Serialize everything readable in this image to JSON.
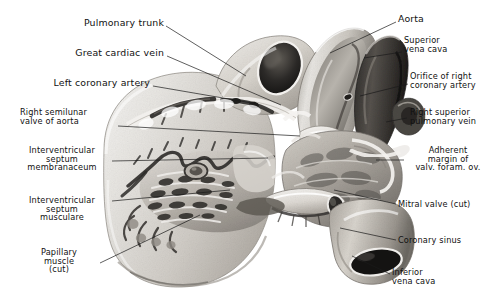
{
  "figure": {
    "kind": "grayscale anatomical photograph",
    "background_color": "#ffffff",
    "tissue_light": "#e9e7e4",
    "tissue_mid": "#b9b5ae",
    "tissue_dark": "#4a4744",
    "lumen_black": "#1a1a1a"
  },
  "labels": {
    "left": [
      {
        "name": "pulmonary-trunk",
        "lines": [
          "Pulmonary trunk"
        ],
        "size": "lg",
        "align": "rt",
        "x": 58,
        "y": 18,
        "w": 106,
        "leader": [
          [
            166,
            26
          ],
          [
            246,
            76
          ]
        ]
      },
      {
        "name": "great-cardiac-vein",
        "lines": [
          "Great cardiac vein"
        ],
        "size": "lg",
        "align": "rt",
        "x": 40,
        "y": 48,
        "w": 124,
        "leader": [
          [
            167,
            56
          ],
          [
            281,
            105
          ]
        ]
      },
      {
        "name": "left-coronary-artery",
        "lines": [
          "Left coronary artery"
        ],
        "size": "lg",
        "align": "rt",
        "x": 22,
        "y": 78,
        "w": 128,
        "leader": [
          [
            153,
            86
          ],
          [
            258,
            104
          ]
        ]
      },
      {
        "name": "right-semilunar-valve-of-aorta",
        "lines": [
          "Right semilunar",
          "valve of aorta"
        ],
        "size": "md",
        "align": "lf",
        "x": 20,
        "y": 108,
        "w": 96,
        "leader": [
          [
            118,
            126
          ],
          [
            300,
            136
          ]
        ]
      },
      {
        "name": "interventricular-septum-membranaceum",
        "lines": [
          "Interventricular",
          "septum",
          "membranaceum"
        ],
        "size": "md",
        "align": "ctr",
        "x": 14,
        "y": 146,
        "w": 96,
        "leader": [
          [
            112,
            161
          ],
          [
            268,
            158
          ]
        ]
      },
      {
        "name": "interventricular-septum-musculare",
        "lines": [
          "Interventricular",
          "septum",
          "musculare"
        ],
        "size": "md",
        "align": "ctr",
        "x": 14,
        "y": 196,
        "w": 96,
        "leader": [
          [
            112,
            201
          ],
          [
            230,
            190
          ]
        ]
      },
      {
        "name": "papillary-muscle-cut",
        "lines": [
          "Papillary",
          "muscle",
          "(cut)"
        ],
        "size": "md",
        "align": "ctr",
        "x": 20,
        "y": 248,
        "w": 78,
        "leader": [
          [
            100,
            263
          ],
          [
            200,
            215
          ]
        ]
      }
    ],
    "right": [
      {
        "name": "aorta",
        "lines": [
          "Aorta"
        ],
        "size": "lg",
        "align": "lf",
        "x": 398,
        "y": 14,
        "w": 88,
        "leader": [
          [
            396,
            22
          ],
          [
            330,
            53
          ]
        ]
      },
      {
        "name": "superior-vena-cava",
        "lines": [
          "Superior",
          "vena cava"
        ],
        "size": "md",
        "align": "lf",
        "x": 404,
        "y": 36,
        "w": 84,
        "leader": [
          [
            402,
            52
          ],
          [
            364,
            58
          ]
        ]
      },
      {
        "name": "orifice-of-right-coronary-artery",
        "lines": [
          "Orifice of right",
          "coronary artery"
        ],
        "size": "md",
        "align": "lf",
        "x": 410,
        "y": 72,
        "w": 80,
        "leader": [
          [
            408,
            84
          ],
          [
            360,
            96
          ]
        ]
      },
      {
        "name": "right-superior-pulmonary-vein",
        "lines": [
          "Right superior",
          "pulmonary vein"
        ],
        "size": "md",
        "align": "lf",
        "x": 410,
        "y": 108,
        "w": 80,
        "leader": [
          [
            407,
            118
          ],
          [
            386,
            122
          ]
        ]
      },
      {
        "name": "adherent-margin-of-valv-foram-ov",
        "lines": [
          "Adherent",
          "margin of",
          "valv. foram. ov."
        ],
        "size": "md",
        "align": "ctr",
        "x": 406,
        "y": 146,
        "w": 84,
        "leader": [
          [
            404,
            160
          ],
          [
            376,
            160
          ]
        ]
      },
      {
        "name": "mitral-valve-cut",
        "lines": [
          "Mitral valve (cut)"
        ],
        "size": "md",
        "align": "lf",
        "x": 398,
        "y": 200,
        "w": 90,
        "leader": [
          [
            396,
            204
          ],
          [
            334,
            190
          ]
        ]
      },
      {
        "name": "coronary-sinus",
        "lines": [
          "Coronary sinus"
        ],
        "size": "md",
        "align": "lf",
        "x": 398,
        "y": 236,
        "w": 86,
        "leader": [
          [
            396,
            240
          ],
          [
            340,
            228
          ]
        ]
      },
      {
        "name": "inferior-vena-cava",
        "lines": [
          "Inferior",
          "vena cava"
        ],
        "size": "md",
        "align": "lf",
        "x": 392,
        "y": 268,
        "w": 84,
        "leader": [
          [
            390,
            274
          ],
          [
            352,
            256
          ]
        ]
      }
    ]
  }
}
